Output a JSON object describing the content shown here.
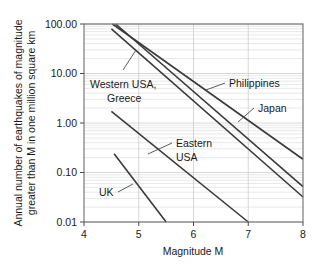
{
  "chart_data": {
    "type": "line",
    "title": "",
    "xlabel": "Magnitude M",
    "ylabel": "Annual number of earthquakes of magnitude greater than M in one million square km",
    "ylabel_line1": "Annual number of earthquakes of magnitude",
    "ylabel_line2": "greater than M in one million square km",
    "xlim": [
      4,
      8
    ],
    "ylim": [
      0.01,
      100
    ],
    "yscale": "log",
    "xscale": "linear",
    "grid": true,
    "grid_style": "horizontal minor log gridlines",
    "legend_position": "inline annotations with leader lines",
    "xticks": [
      "4",
      "5",
      "6",
      "7",
      "8"
    ],
    "xtick_values": [
      4,
      5,
      6,
      7,
      8
    ],
    "yticks": [
      "100.00",
      "10.00",
      "1.00",
      "0.10",
      "0.01"
    ],
    "ytick_values": [
      100,
      10,
      1,
      0.1,
      0.01
    ],
    "series": [
      {
        "name": "Philippines",
        "label": "Philippines",
        "x": [
          4.52,
          8.0
        ],
        "values": [
          100,
          0.185
        ],
        "annotation_xy": [
          6.05,
          4.6
        ]
      },
      {
        "name": "Japan",
        "label": "Japan",
        "x": [
          4.58,
          8.0
        ],
        "values": [
          100,
          0.052
        ],
        "annotation_xy": [
          7.05,
          0.8
        ]
      },
      {
        "name": "Western USA, Greece",
        "label": "Western USA, Greece",
        "label_line1": "Western USA,",
        "label_line2": "Greece",
        "x": [
          4.5,
          8.0
        ],
        "values": [
          80,
          0.032
        ],
        "annotation_xy": [
          5.18,
          16.0
        ]
      },
      {
        "name": "Eastern USA",
        "label": "Eastern USA",
        "label_line1": "Eastern",
        "label_line2": "USA",
        "x": [
          4.5,
          7.0
        ],
        "values": [
          1.72,
          0.01
        ],
        "annotation_xy": [
          5.52,
          0.4
        ]
      },
      {
        "name": "UK",
        "label": "UK",
        "x": [
          4.55,
          5.5
        ],
        "values": [
          0.24,
          0.01
        ],
        "annotation_xy": [
          5.0,
          0.065
        ]
      }
    ]
  },
  "axes": {
    "x_axis_title": "Magnitude M",
    "y_axis_title_line1": "Annual number of earthquakes of magnitude",
    "y_axis_title_line2": "greater than M in one million square km"
  },
  "colors": {
    "line": "#3a3a3a",
    "frame": "#6e6e6e",
    "gridline": "#d8d8d8",
    "background": "#ffffff",
    "text": "#1a1a1a"
  }
}
